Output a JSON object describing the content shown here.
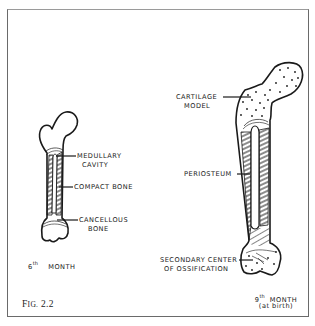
{
  "figure": {
    "caption": "Fig. 2.2",
    "caption_prefix": "F",
    "caption_smallcaps": "IG.",
    "caption_number": "2.2"
  },
  "left_bone": {
    "stage_number": "6",
    "stage_suffix": "th",
    "stage_word": "MONTH",
    "labels": {
      "medullary_line1": "MEDULLARY",
      "medullary_line2": "CAVITY",
      "compact": "COMPACT BONE",
      "cancellous_line1": "CANCELLOUS",
      "cancellous_line2": "BONE"
    }
  },
  "right_bone": {
    "stage_number": "9",
    "stage_suffix": "th",
    "stage_word": "MONTH",
    "stage_note": "(at birth)",
    "labels": {
      "cartilage_line1": "CARTILAGE",
      "cartilage_line2": "MODEL",
      "periosteum": "PERIOSTEUM",
      "secondary_line1": "SECONDARY CENTER",
      "secondary_line2": "OF OSSIFICATION"
    }
  },
  "colors": {
    "ink": "#1a1a1a",
    "frame": "#6a6a6a",
    "background": "#ffffff"
  }
}
